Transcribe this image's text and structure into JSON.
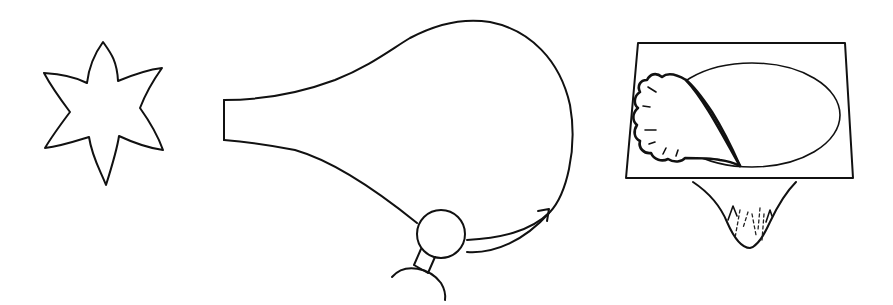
{
  "figure": {
    "background": "#ffffff",
    "ink_color": "#111111",
    "panels": [
      {
        "id": "star",
        "description": "six-pointed star / flower outline",
        "center": [
          105,
          113
        ],
        "points": 6
      },
      {
        "id": "bulb",
        "description": "flask-shaped bulb with open tapered neck, small circular sphere attached at base with a stem joint to a partial arc, and a curved arrow indicating rotation",
        "neck_left_x": 224,
        "sphere_center": [
          437,
          262
        ],
        "sphere_radius": 24,
        "arrow_tip": [
          549,
          213
        ]
      },
      {
        "id": "tray",
        "description": "trapezoidal plate containing an ellipse partly overlapped by a frilly lobed shape, with a funnel cone beneath containing dashed fringes",
        "plate_corners": [
          [
            638,
            43
          ],
          [
            845,
            43
          ],
          [
            853,
            178
          ],
          [
            626,
            178
          ]
        ],
        "ellipse_center": [
          752,
          115
        ],
        "ellipse_radii": [
          88,
          52
        ],
        "funnel_tip": [
          750,
          248
        ]
      }
    ]
  }
}
